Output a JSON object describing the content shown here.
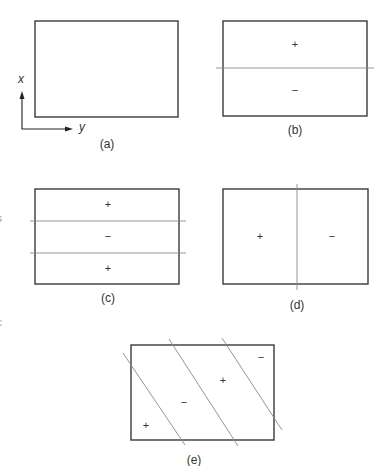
{
  "figure": {
    "axes": {
      "vertical_label": "x",
      "horizontal_label": "y"
    },
    "edge_fragments": [
      "s",
      "c"
    ],
    "panels": [
      {
        "id": "a",
        "caption": "(a)",
        "signs": []
      },
      {
        "id": "b",
        "caption": "(b)",
        "signs": [
          "+",
          "−"
        ]
      },
      {
        "id": "c",
        "caption": "(c)",
        "signs": [
          "+",
          "−",
          "+"
        ]
      },
      {
        "id": "d",
        "caption": "(d)",
        "signs": [
          "+",
          "−"
        ]
      },
      {
        "id": "e",
        "caption": "(e)",
        "signs": [
          "+",
          "−",
          "+",
          "−"
        ]
      }
    ]
  },
  "colors": {
    "box_stroke": "#3a3a3a",
    "divider_stroke": "#8a8a8a",
    "text": "#333333"
  }
}
